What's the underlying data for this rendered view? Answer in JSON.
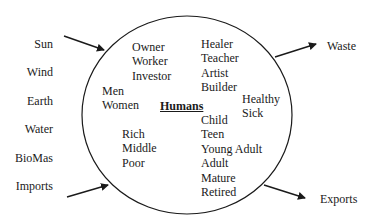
{
  "diagram": {
    "center_label": "Humans",
    "inputs": [
      "Sun",
      "Wind",
      "Earth",
      "Water",
      "BioMas",
      "Imports"
    ],
    "outputs": [
      "Waste",
      "Exports"
    ],
    "groups": {
      "roles": [
        "Owner",
        "Worker",
        "Investor"
      ],
      "occupations": [
        "Healer",
        "Teacher",
        "Artist",
        "Builder"
      ],
      "gender": [
        "Men",
        "Women"
      ],
      "health": [
        "Healthy",
        "Sick"
      ],
      "wealth": [
        "Rich",
        "Middle",
        "Poor"
      ],
      "age": [
        "Child",
        "Teen",
        "Young Adult",
        "Adult",
        "Mature",
        "Retired"
      ]
    },
    "arrows": [
      {
        "from": "Sun",
        "to": "circle"
      },
      {
        "from": "Imports",
        "to": "circle"
      },
      {
        "from": "circle",
        "to": "Waste"
      },
      {
        "from": "circle",
        "to": "Exports"
      }
    ],
    "colors": {
      "stroke": "#1a1a1a",
      "background": "#ffffff"
    }
  }
}
